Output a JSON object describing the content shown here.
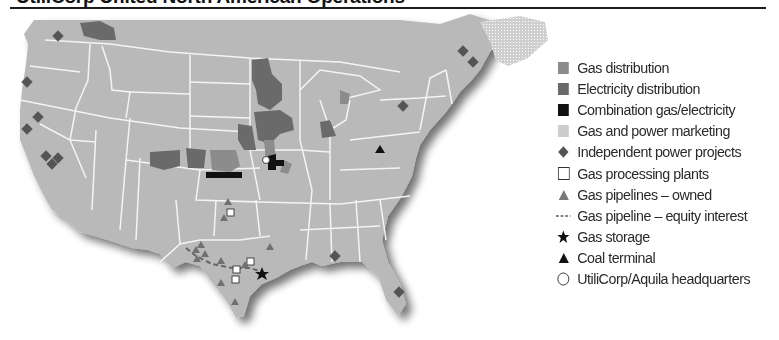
{
  "title": "UtiliCorp United North American Operations",
  "colors": {
    "land": "#b9b9b9",
    "state_border": "#f2f2f2",
    "gas_distribution": "#8c8c8c",
    "electricity_distribution": "#6a6a6a",
    "combination": "#111111",
    "marketing": "#cdcdcd",
    "marker_gray": "#555555",
    "shadow": "#8a8a8a"
  },
  "legend": {
    "items": [
      {
        "key": "gas_distribution",
        "symbol": "square-gray",
        "label": "Gas distribution"
      },
      {
        "key": "electricity_distribution",
        "symbol": "square-darkgray",
        "label": "Electricity distribution"
      },
      {
        "key": "combination",
        "symbol": "square-black",
        "label": "Combination gas/electricity"
      },
      {
        "key": "marketing",
        "symbol": "square-light",
        "label": "Gas and power marketing"
      },
      {
        "key": "independent_power",
        "symbol": "diamond",
        "label": "Independent power projects"
      },
      {
        "key": "gas_processing",
        "symbol": "square-outline",
        "label": "Gas processing plants"
      },
      {
        "key": "pipelines_owned",
        "symbol": "triangle-gray",
        "label": "Gas pipelines – owned"
      },
      {
        "key": "pipeline_equity",
        "symbol": "dashed-line",
        "label": "Gas pipeline – equity interest"
      },
      {
        "key": "gas_storage",
        "symbol": "star",
        "label": "Gas storage"
      },
      {
        "key": "coal_terminal",
        "symbol": "triangle-black",
        "label": "Coal terminal"
      },
      {
        "key": "headquarters",
        "symbol": "circle-outline",
        "label": "UtiliCorp/Aquila headquarters"
      }
    ]
  },
  "map": {
    "region": "Continental United States and southern Canada",
    "independent_power_projects": [
      {
        "x": 58,
        "y": 36
      },
      {
        "x": 27,
        "y": 82
      },
      {
        "x": 38,
        "y": 117
      },
      {
        "x": 27,
        "y": 129
      },
      {
        "x": 46,
        "y": 156
      },
      {
        "x": 52,
        "y": 164
      },
      {
        "x": 58,
        "y": 158
      },
      {
        "x": 463,
        "y": 51
      },
      {
        "x": 473,
        "y": 62
      },
      {
        "x": 403,
        "y": 106
      },
      {
        "x": 335,
        "y": 256
      },
      {
        "x": 399,
        "y": 292
      }
    ],
    "gas_processing_plants": [
      {
        "x": 231,
        "y": 213
      },
      {
        "x": 237,
        "y": 270
      },
      {
        "x": 251,
        "y": 262
      },
      {
        "x": 236,
        "y": 279
      }
    ],
    "pipelines_owned": [
      {
        "x": 228,
        "y": 202
      },
      {
        "x": 224,
        "y": 218
      },
      {
        "x": 201,
        "y": 245
      },
      {
        "x": 196,
        "y": 250
      },
      {
        "x": 205,
        "y": 254
      },
      {
        "x": 197,
        "y": 259
      },
      {
        "x": 221,
        "y": 261
      },
      {
        "x": 245,
        "y": 265
      },
      {
        "x": 221,
        "y": 283
      },
      {
        "x": 235,
        "y": 302
      },
      {
        "x": 270,
        "y": 247
      }
    ],
    "gas_storage": [
      {
        "x": 262,
        "y": 274
      }
    ],
    "coal_terminal": [
      {
        "x": 380,
        "y": 150
      }
    ],
    "headquarters": [
      {
        "x": 266,
        "y": 160
      }
    ]
  }
}
